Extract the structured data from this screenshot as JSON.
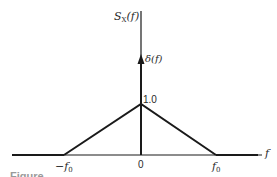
{
  "diagram": {
    "type": "power-spectral-density",
    "y_axis_label": "S",
    "y_axis_label_sub": "X",
    "y_axis_label_arg": "(f)",
    "x_axis_label": "f",
    "impulse_label": "δ(f)",
    "peak_label": "1.0",
    "ticks": [
      {
        "label": "−f",
        "sub": "0",
        "value": -1
      },
      {
        "label": "0",
        "sub": "",
        "value": 0
      },
      {
        "label": "f",
        "sub": "0",
        "value": 1
      }
    ],
    "caption": "Figure"
  },
  "colors": {
    "ink": "#1a1a1a",
    "background": "#ffffff"
  }
}
